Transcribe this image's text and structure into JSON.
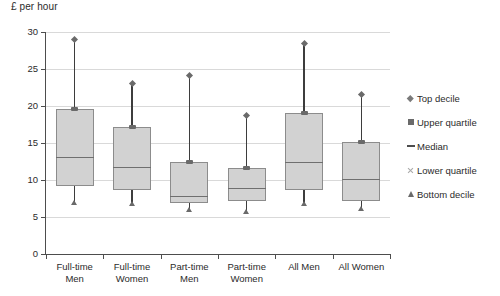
{
  "chart_data": {
    "type": "box",
    "title": "",
    "ylabel": "£ per hour",
    "xlabel": "",
    "ylim": [
      0,
      30
    ],
    "yticks": [
      0,
      5,
      10,
      15,
      20,
      25,
      30
    ],
    "grid": true,
    "legend_position": "right",
    "categories": [
      "Full-time Men",
      "Full-time Women",
      "Part-time Men",
      "Part-time Women",
      "All Men",
      "All Women"
    ],
    "category_lines": [
      [
        "Full-time",
        "Men"
      ],
      [
        "Full-time",
        "Women"
      ],
      [
        "Part-time",
        "Men"
      ],
      [
        "Part-time",
        "Women"
      ],
      [
        "All Men",
        ""
      ],
      [
        "All Women",
        ""
      ]
    ],
    "series": [
      {
        "name": "Bottom decile",
        "values": [
          7.0,
          6.8,
          6.0,
          5.8,
          6.8,
          6.1
        ]
      },
      {
        "name": "Lower quartile",
        "values": [
          9.2,
          8.6,
          6.9,
          7.1,
          8.7,
          7.2
        ]
      },
      {
        "name": "Median",
        "values": [
          13.1,
          11.8,
          7.9,
          8.9,
          12.5,
          10.1
        ]
      },
      {
        "name": "Upper quartile",
        "values": [
          19.6,
          17.1,
          12.4,
          11.6,
          19.0,
          15.2
        ]
      },
      {
        "name": "Top decile",
        "values": [
          29.0,
          23.0,
          24.1,
          18.7,
          28.5,
          21.6
        ]
      }
    ],
    "legend": [
      {
        "label": "Top decile",
        "marker": "diamond-marker"
      },
      {
        "label": "Upper quartile",
        "marker": "square-marker"
      },
      {
        "label": "Median",
        "marker": "dash-marker"
      },
      {
        "label": "Lower quartile",
        "marker": "x-marker"
      },
      {
        "label": "Bottom decile",
        "marker": "triangle-marker"
      }
    ],
    "colors": {
      "box_fill": "#d2d2d2",
      "box_border": "#8c8c8c",
      "whisker": "#3d3d3d",
      "median": "#6f6f6f",
      "gridline": "#d9d9d9",
      "axis": "#4d4d4d",
      "text": "#2b2b2b"
    }
  }
}
